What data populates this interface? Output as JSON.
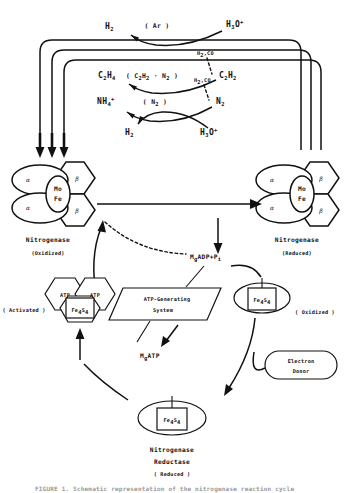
{
  "figure": {
    "title": "Nitrogenase reaction cycle",
    "caption": "FIGURE 1.  Schematic representation of the nitrogenase reaction cycle"
  },
  "substrates": {
    "row1": {
      "product": "H",
      "product_sub": "2",
      "mediator": "( Ar )",
      "substrate": "H",
      "substrate_sub": "3",
      "substrate_tail": "O",
      "substrate_sup": "+"
    },
    "row2": {
      "product": "C",
      "product_sub1": "2",
      "product_mid": "H",
      "product_sub2": "4",
      "mediator": "( C",
      "mediator_sub1": "2",
      "mediator_mid": "H",
      "mediator_sub2": "2",
      "mediator_dot": " · N",
      "mediator_sub3": "2",
      "mediator_end": " )",
      "substrate": "C",
      "substrate_sub1": "2",
      "substrate_mid": "H",
      "substrate_sub2": "2",
      "inhibitor": "H",
      "inhibitor_sub": "2",
      "inhibitor_tail": ",CO"
    },
    "row3": {
      "product": "NH",
      "product_sub": "4",
      "product_sup": "+",
      "mediator": "( N",
      "mediator_sub": "2",
      "mediator_end": " )",
      "substrate": "N",
      "substrate_sub": "2",
      "inhibitor": "H",
      "inhibitor_sub": "2",
      "inhibitor_tail": ",CO"
    },
    "row4": {
      "product": "H",
      "product_sub": "2",
      "substrate": "H",
      "substrate_sub": "3",
      "substrate_tail": "O",
      "substrate_sup": "+"
    }
  },
  "enzymes": {
    "nitrogenase_left": {
      "name": "Nitrogenase",
      "state": "(Oxidized)",
      "core_top": "Mo",
      "core_bottom": "Fe",
      "subunit_alpha": "α",
      "subunit_beta": "β"
    },
    "nitrogenase_right": {
      "name": "Nitrogenase",
      "state": "(Reduced)",
      "core_top": "Mo",
      "core_bottom": "Fe",
      "subunit_alpha": "α",
      "subunit_beta": "β"
    },
    "reductase_activated": {
      "state": "( Activated )",
      "atp_left": "ATP",
      "atp_right": "ATP",
      "cluster": "Fe",
      "cluster_sub1": "4",
      "cluster_mid": "S",
      "cluster_sub2": "4"
    },
    "reductase_oxidized": {
      "state": "( Oxidized )",
      "cluster": "Fe",
      "cluster_sub1": "4",
      "cluster_mid": "S",
      "cluster_sub2": "4"
    },
    "reductase_reduced": {
      "name_line1": "Nitrogenase",
      "name_line2": "Reductase",
      "state": "( Reduced )",
      "cluster": "Fe",
      "cluster_sub1": "4",
      "cluster_mid": "S",
      "cluster_sub2": "4"
    }
  },
  "nodes": {
    "atp_system_line1": "ATP-Generating",
    "atp_system_line2": "System",
    "electron_donor_line1": "Electron",
    "electron_donor_line2": "Donor",
    "mg_adp": "M",
    "mg_adp_sub": "g",
    "mg_adp_tail": "ADP+P",
    "mg_adp_sub2": "i",
    "mg_atp": "M",
    "mg_atp_sub": "g",
    "mg_atp_tail": "ATP"
  },
  "colors": {
    "stroke": "#111111",
    "background": "#ffffff",
    "caption": "#9a9a9a"
  }
}
